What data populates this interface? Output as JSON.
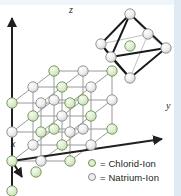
{
  "figure": {
    "background_color": "#ffffff",
    "edge_strip_color": "#dfeaf2"
  },
  "axes": [
    {
      "name": "z-axis",
      "label": "z",
      "direction": "up",
      "label_x": 69,
      "label_y": 5
    },
    {
      "name": "y-axis",
      "label": "y",
      "direction": "right",
      "label_x": 166,
      "label_y": 106
    },
    {
      "name": "x-axis",
      "label": "x",
      "direction": "down-left",
      "label_x": 11,
      "label_y": 142
    }
  ],
  "legend": {
    "items": [
      {
        "marker": "circle-green",
        "color": "#dfeccf",
        "outline": "#6d9455",
        "label": "= Chlorid-Ion"
      },
      {
        "marker": "circle-grey",
        "color": "#eeeeee",
        "outline": "#8a8a8a",
        "label": "= Natrium-Ion"
      }
    ],
    "row_y": [
      158,
      172
    ]
  },
  "lattice": {
    "type": "rock-salt-cubic",
    "grid": "3 x 3 x 3",
    "ion_radius_px": 5.2,
    "chlorid_color": "#dfeccf",
    "chlorid_outline": "#6d9455",
    "natrium_color": "#ededed",
    "natrium_outline": "#8b8b8b",
    "bond_color": "#9a9a9a",
    "basis_ax": -21,
    "basis_ay": 16,
    "basis_bx": 29,
    "basis_by": 0,
    "basis_cx": 0,
    "basis_cy": -29,
    "origin_x": 54,
    "origin_y": 129
  },
  "octahedron": {
    "name": "coordination-octahedron",
    "description": "Oktaeder aus sechs Natrium-Ionen um ein Chlorid-Ion",
    "center": {
      "cx": 130,
      "cy": 46,
      "ion": "chlorid"
    },
    "vertices": [
      {
        "cx": 130,
        "cy": 14,
        "ion": "natrium"
      },
      {
        "cx": 130,
        "cy": 78,
        "ion": "natrium"
      },
      {
        "cx": 101,
        "cy": 44,
        "ion": "natrium"
      },
      {
        "cx": 166,
        "cy": 48,
        "ion": "natrium"
      },
      {
        "cx": 111,
        "cy": 57,
        "ion": "natrium"
      },
      {
        "cx": 148,
        "cy": 34,
        "ion": "natrium"
      }
    ],
    "edge_color": "#1a1a1a",
    "edge_color_back": "#b9b9b9"
  }
}
